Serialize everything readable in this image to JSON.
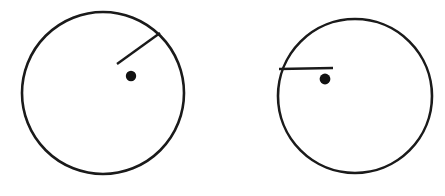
{
  "figure": {
    "title": "",
    "width": 445,
    "height": 196,
    "background_color": "#ffffff",
    "stroke_color": "#1a1a1a",
    "fill_color": "none",
    "dot_color": "#111111"
  },
  "shapes": {
    "figures": [
      {
        "name": "left-circle-figure",
        "label": "Left circle",
        "circle": {
          "cx": 103,
          "cy": 93,
          "r": 81,
          "stroke_width": 2.6,
          "stroke_color": "#1a1a1a",
          "fill": "none"
        },
        "line": {
          "label": "diagonal radius line",
          "orientation": "diagonal",
          "x1": 160,
          "y1": 33,
          "x2": 117,
          "y2": 64,
          "stroke_width": 2.4,
          "stroke_color": "#1a1a1a"
        },
        "dot": {
          "label": "center dot",
          "cx": 131,
          "cy": 76,
          "r": 5.2,
          "fill": "#111111"
        }
      },
      {
        "name": "right-circle-figure",
        "label": "Right circle",
        "circle": {
          "cx": 355,
          "cy": 96,
          "r": 77,
          "stroke_width": 2.6,
          "stroke_color": "#1a1a1a",
          "fill": "none"
        },
        "line": {
          "label": "horizontal radius line",
          "orientation": "horizontal",
          "x1": 279,
          "y1": 69,
          "x2": 333,
          "y2": 68,
          "stroke_width": 2.4,
          "stroke_color": "#1a1a1a"
        },
        "dot": {
          "label": "center dot",
          "cx": 325,
          "cy": 79,
          "r": 5.4,
          "fill": "#111111"
        }
      }
    ]
  }
}
